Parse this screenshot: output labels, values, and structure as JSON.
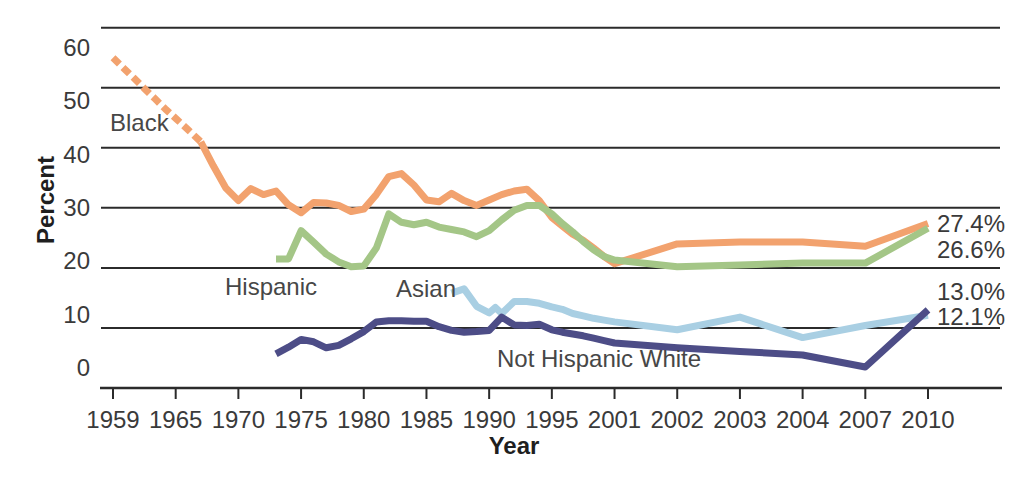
{
  "chart_data": {
    "type": "line",
    "title": "",
    "xlabel": "Year",
    "ylabel": "Percent",
    "x_ticks": [
      1959,
      1965,
      1970,
      1975,
      1980,
      1985,
      1990,
      1995,
      2001,
      2002,
      2003,
      2004,
      2007,
      2010
    ],
    "y_ticks": [
      60,
      50,
      40,
      30,
      20,
      10,
      0
    ],
    "ylim": [
      0,
      63
    ],
    "grid": "horizontal-only",
    "legend": "inline-labels",
    "colors": {
      "grid": "#2b2b2b",
      "text": "#3a3a3a",
      "background": "#ffffff"
    },
    "series": [
      {
        "name": "Black",
        "color": "#F2A26E",
        "dash_until": 1967,
        "end_label": "27.4%",
        "points": [
          [
            1959,
            55
          ],
          [
            1960,
            53.3
          ],
          [
            1961,
            51.6
          ],
          [
            1962,
            49.9
          ],
          [
            1963,
            48.2
          ],
          [
            1964,
            46.5
          ],
          [
            1965,
            44.9
          ],
          [
            1966,
            43
          ],
          [
            1967,
            41
          ],
          [
            1968,
            37
          ],
          [
            1969,
            33.3
          ],
          [
            1970,
            31.2
          ],
          [
            1971,
            33.2
          ],
          [
            1972,
            32.2
          ],
          [
            1973,
            32.8
          ],
          [
            1974,
            30.5
          ],
          [
            1975,
            29.2
          ],
          [
            1976,
            30.9
          ],
          [
            1977,
            30.8
          ],
          [
            1978,
            30.4
          ],
          [
            1979,
            29.4
          ],
          [
            1980,
            29.8
          ],
          [
            1981,
            32.2
          ],
          [
            1982,
            35.2
          ],
          [
            1983,
            35.7
          ],
          [
            1984,
            33.8
          ],
          [
            1985,
            31.3
          ],
          [
            1986,
            31.0
          ],
          [
            1987,
            32.4
          ],
          [
            1988,
            31.2
          ],
          [
            1989,
            30.4
          ],
          [
            1990,
            31.3
          ],
          [
            1991,
            32.2
          ],
          [
            1992,
            32.8
          ],
          [
            1993,
            33.1
          ],
          [
            1994,
            31.2
          ],
          [
            1995,
            28.4
          ],
          [
            1996,
            27.0
          ],
          [
            1997,
            25.6
          ],
          [
            1998,
            24.6
          ],
          [
            1999,
            23.3
          ],
          [
            2000,
            21.9
          ],
          [
            2001,
            20.7
          ],
          [
            2002,
            24.0
          ],
          [
            2003,
            24.3
          ],
          [
            2004,
            24.3
          ],
          [
            2007,
            23.6
          ],
          [
            2010,
            27.4
          ]
        ]
      },
      {
        "name": "Hispanic",
        "color": "#A4C687",
        "end_label": "26.6%",
        "points": [
          [
            1973,
            21.5
          ],
          [
            1974,
            21.5
          ],
          [
            1975,
            26.2
          ],
          [
            1976,
            24.3
          ],
          [
            1977,
            22.3
          ],
          [
            1978,
            21.0
          ],
          [
            1979,
            20.2
          ],
          [
            1980,
            20.3
          ],
          [
            1981,
            23.3
          ],
          [
            1982,
            29.0
          ],
          [
            1983,
            27.6
          ],
          [
            1984,
            27.2
          ],
          [
            1985,
            27.6
          ],
          [
            1986,
            26.8
          ],
          [
            1987,
            26.4
          ],
          [
            1988,
            26.0
          ],
          [
            1989,
            25.2
          ],
          [
            1990,
            26.2
          ],
          [
            1991,
            28.0
          ],
          [
            1992,
            29.6
          ],
          [
            1993,
            30.4
          ],
          [
            1994,
            30.4
          ],
          [
            1995,
            29.0
          ],
          [
            1996,
            27.4
          ],
          [
            1997,
            26.0
          ],
          [
            1998,
            24.4
          ],
          [
            1999,
            23.0
          ],
          [
            2000,
            21.9
          ],
          [
            2001,
            21.3
          ],
          [
            2002,
            20.2
          ],
          [
            2003,
            20.5
          ],
          [
            2004,
            20.8
          ],
          [
            2007,
            20.8
          ],
          [
            2010,
            26.6
          ]
        ]
      },
      {
        "name": "Asian",
        "color": "#A9CFE3",
        "end_label": "12.1%",
        "points": [
          [
            1987,
            15.8
          ],
          [
            1988,
            16.5
          ],
          [
            1989,
            13.6
          ],
          [
            1990,
            12.5
          ],
          [
            1990.5,
            13.4
          ],
          [
            1991,
            12.4
          ],
          [
            1992,
            14.4
          ],
          [
            1993,
            14.4
          ],
          [
            1994,
            14.1
          ],
          [
            1995,
            13.5
          ],
          [
            1996,
            13.1
          ],
          [
            1997,
            12.4
          ],
          [
            1998,
            12.0
          ],
          [
            1999,
            11.6
          ],
          [
            2000,
            11.3
          ],
          [
            2001,
            11.0
          ],
          [
            2002,
            9.7
          ],
          [
            2003,
            11.8
          ],
          [
            2004,
            8.4
          ],
          [
            2007,
            10.4
          ],
          [
            2010,
            12.1
          ]
        ]
      },
      {
        "name": "Not Hispanic White",
        "color": "#4D4D87",
        "end_label": "13.0%",
        "points": [
          [
            1973,
            5.7
          ],
          [
            1974,
            6.8
          ],
          [
            1975,
            8.1
          ],
          [
            1976,
            7.7
          ],
          [
            1977,
            6.7
          ],
          [
            1978,
            7.1
          ],
          [
            1979,
            8.2
          ],
          [
            1980,
            9.4
          ],
          [
            1981,
            11.0
          ],
          [
            1982,
            11.2
          ],
          [
            1983,
            11.2
          ],
          [
            1984,
            11.1
          ],
          [
            1985,
            11.1
          ],
          [
            1986,
            10.2
          ],
          [
            1987,
            9.6
          ],
          [
            1988,
            9.3
          ],
          [
            1989,
            9.4
          ],
          [
            1990,
            9.6
          ],
          [
            1991,
            11.8
          ],
          [
            1992,
            10.5
          ],
          [
            1993,
            10.4
          ],
          [
            1994,
            10.6
          ],
          [
            1995,
            9.7
          ],
          [
            1996,
            9.3
          ],
          [
            1997,
            9.0
          ],
          [
            1998,
            8.7
          ],
          [
            1999,
            8.3
          ],
          [
            2000,
            7.9
          ],
          [
            2001,
            7.5
          ],
          [
            2002,
            6.7
          ],
          [
            2003,
            6.1
          ],
          [
            2004,
            5.5
          ],
          [
            2007,
            3.5
          ],
          [
            2010,
            13.0
          ]
        ]
      }
    ],
    "annotations": [
      {
        "kind": "series",
        "text": "Black",
        "x": 110,
        "y": 123,
        "align": "left"
      },
      {
        "kind": "series",
        "text": "Hispanic",
        "x": 225,
        "y": 287,
        "align": "left"
      },
      {
        "kind": "series",
        "text": "Asian",
        "x": 396,
        "y": 289,
        "align": "left"
      },
      {
        "kind": "series",
        "text": "Not Hispanic White",
        "x": 497,
        "y": 359,
        "align": "left"
      },
      {
        "kind": "value",
        "text": "27.4%",
        "x": 1005,
        "y": 224,
        "align": "right"
      },
      {
        "kind": "value",
        "text": "26.6%",
        "x": 1005,
        "y": 250,
        "align": "right"
      },
      {
        "kind": "value",
        "text": "13.0%",
        "x": 1005,
        "y": 292,
        "align": "right"
      },
      {
        "kind": "value",
        "text": "12.1%",
        "x": 1005,
        "y": 317,
        "align": "right"
      }
    ]
  }
}
